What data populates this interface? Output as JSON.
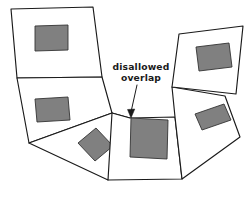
{
  "figure": {
    "width": 251,
    "height": 204,
    "background_color": "#ffffff",
    "type": "diagram"
  },
  "style": {
    "outline_color": "#1a1a1a",
    "outline_width": 1.15,
    "patch_fill_color": "#808080",
    "patch_stroke_color": "#333333",
    "leader_color": "#1a1a1a",
    "text_color": "#1a1a1a"
  },
  "annotation": {
    "name": "disallowed-overlap",
    "line1": "disallowed",
    "line2": "overlap",
    "text_anchor_x": 141,
    "text_line1_y": 70,
    "text_line2_y": 81,
    "leader_path": "M 137 85 L 131 112",
    "arrow_head_points": "131,118 127.5,109.5 134.8,109.0",
    "points_to_x": 131,
    "points_to_y": 118
  },
  "cells": [
    {
      "id": "cell-top-left",
      "label": "top-left cell",
      "outline_points": "11,9 93,7 102,77 17,78",
      "patch": {
        "id": "patch-top-left",
        "label": "top-left rectangle",
        "points": "35,26 68,25 68,50 35,51",
        "overlaps_boundary": false
      }
    },
    {
      "id": "cell-mid-left",
      "label": "middle-left cell",
      "outline_points": "17,78 102,77 112,113 29,143",
      "patch": {
        "id": "patch-mid-left",
        "label": "middle-left rectangle",
        "points": "35,99 68,97 70,120 37,122",
        "overlaps_boundary": false
      }
    },
    {
      "id": "cell-bottom-left",
      "label": "bottom-left cell",
      "outline_points": "29,143 112,113 130,118 108,180",
      "patch": {
        "id": "patch-bottom-left",
        "label": "bottom-left rotated rectangle",
        "points": "78,143 96,128 113,146 95,161",
        "overlaps_boundary": false
      }
    },
    {
      "id": "cell-bottom-center",
      "label": "bottom-center cell",
      "outline_points": "112,113 130,118 175,117 182,179 108,180",
      "patch": {
        "id": "patch-bottom-center",
        "label": "center rectangle that overlaps the cell boundary",
        "points": "131,118 168,120 167,159 130,157",
        "overlaps_boundary": true
      }
    },
    {
      "id": "cell-right-lower",
      "label": "right-lower cell",
      "outline_points": "175,117 172,87 225,96 240,137 182,179",
      "patch": {
        "id": "patch-right-lower",
        "label": "right-lower rotated rectangle",
        "points": "195,114 224,104 231,120 202,130",
        "overlaps_boundary": false
      }
    },
    {
      "id": "cell-top-right",
      "label": "top-right cell",
      "outline_points": "172,87 179,34 243,26 236,94",
      "patch": {
        "id": "patch-top-right",
        "label": "top-right rectangle",
        "points": "196,47 229,43 232,67 199,71",
        "overlaps_boundary": false
      }
    }
  ]
}
